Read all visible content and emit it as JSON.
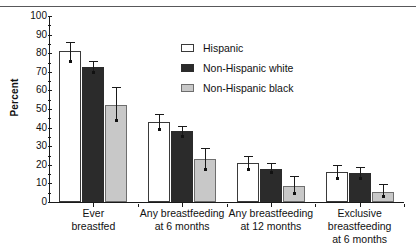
{
  "chart_data": {
    "type": "bar",
    "title": "",
    "xlabel": "",
    "ylabel": "Percent",
    "ylim": [
      0,
      100
    ],
    "ytick_step": 10,
    "yticks": [
      "0",
      "10",
      "20",
      "30",
      "40",
      "50",
      "60",
      "70",
      "80",
      "90",
      "100"
    ],
    "grid": false,
    "legend_position": "upper center",
    "categories": [
      "Ever breastfed",
      "Any breastfeeding at 6 months",
      "Any breastfeeding at 12 months",
      "Exclusive breastfeeding at 6 months"
    ],
    "category_lines": [
      [
        "Ever",
        "breastfed"
      ],
      [
        "Any breastfeeding",
        "at 6 months"
      ],
      [
        "Any breastfeeding",
        "at 12 months"
      ],
      [
        "Exclusive breastfeeding",
        "at 6 months"
      ]
    ],
    "series": [
      {
        "name": "Hispanic",
        "color": "#ffffff",
        "values": [
          81,
          43,
          21,
          16
        ],
        "err_low": [
          76,
          39,
          18,
          13
        ],
        "err_high": [
          86,
          47.5,
          25,
          20
        ]
      },
      {
        "name": "Non-Hispanic white",
        "color": "#2b2b2b",
        "values": [
          72.5,
          38,
          18,
          15.5
        ],
        "err_low": [
          70,
          35.5,
          16,
          13
        ],
        "err_high": [
          76,
          41,
          21,
          19
        ]
      },
      {
        "name": "Non-Hispanic black",
        "color": "#c8c8c8",
        "values": [
          52,
          23,
          8.5,
          5.5
        ],
        "err_low": [
          44,
          18,
          5,
          3
        ],
        "err_high": [
          62,
          29,
          14,
          9.5
        ]
      }
    ]
  },
  "legend": {
    "items": [
      {
        "label": "Hispanic",
        "swatch": "open"
      },
      {
        "label": "Non-Hispanic white",
        "swatch": "black"
      },
      {
        "label": "Non-Hispanic black",
        "swatch": "gray"
      }
    ]
  },
  "axes": {
    "y_title": "Percent"
  }
}
